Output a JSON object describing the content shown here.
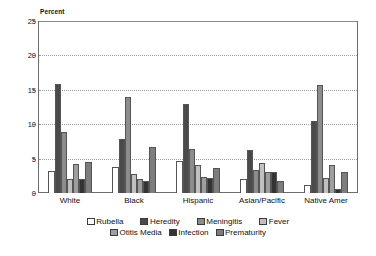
{
  "chart_data": {
    "type": "bar",
    "title": "",
    "subtitle": "",
    "xlabel": "",
    "ylabel": "Percent",
    "ylim": [
      0,
      25
    ],
    "ytick_step": 5,
    "yticks": [
      "0",
      "5",
      "10",
      "15",
      "20",
      "25"
    ],
    "grid": true,
    "grid_axis": "y",
    "legend_position": "bottom",
    "legend_rows": 2,
    "categories": [
      "White",
      "Black",
      "Hispanic",
      "Asian/Pacific",
      "Native Amer"
    ],
    "series": [
      {
        "name": "Rubella",
        "color": "#ffffff",
        "values": [
          3.2,
          3.8,
          4.6,
          2.0,
          1.2
        ]
      },
      {
        "name": "Heredity",
        "color": "#4a4a4a",
        "values": [
          15.8,
          7.8,
          13.0,
          6.2,
          10.5
        ]
      },
      {
        "name": "Meningitis",
        "color": "#8c8c8c",
        "values": [
          8.8,
          13.9,
          6.4,
          3.4,
          15.7
        ]
      },
      {
        "name": "Fever",
        "color": "#c0c0c0",
        "values": [
          2.1,
          2.7,
          4.0,
          4.4,
          2.2
        ]
      },
      {
        "name": "Otitis Media",
        "color": "#9e9e9e",
        "values": [
          4.2,
          2.1,
          2.4,
          3.1,
          4.0
        ]
      },
      {
        "name": "Infection",
        "color": "#333333",
        "values": [
          2.1,
          1.8,
          2.2,
          3.0,
          0.6
        ]
      },
      {
        "name": "Prematurity",
        "color": "#7d7d7d",
        "values": [
          4.5,
          6.7,
          3.7,
          1.8,
          3.0
        ]
      }
    ]
  },
  "axis": {
    "y_title": "Percent"
  }
}
